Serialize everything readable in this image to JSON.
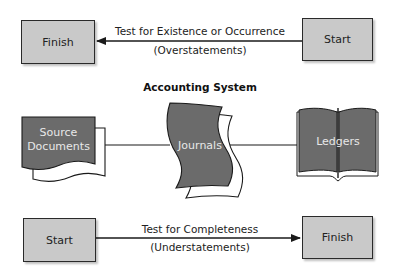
{
  "top_flow": {
    "left_box": "Finish",
    "right_box": "Start",
    "label_line1": "Test for Existence or Occurrence",
    "label_line2": "(Overstatements)",
    "direction": "right-to-left"
  },
  "accounting_system": {
    "title": "Accounting System",
    "source_documents": "Source Documents",
    "source_line1": "Source",
    "source_line2": "Documents",
    "journals": "Journals",
    "ledgers": "Ledgers"
  },
  "bottom_flow": {
    "left_box": "Start",
    "right_box": "Finish",
    "label_line1": "Test for Completeness",
    "label_line2": "(Understatements)",
    "direction": "left-to-right"
  },
  "colors": {
    "box_fill": "#c9c9c9",
    "shape_fill": "#6b6b6b",
    "line": "#1a1a1a"
  }
}
